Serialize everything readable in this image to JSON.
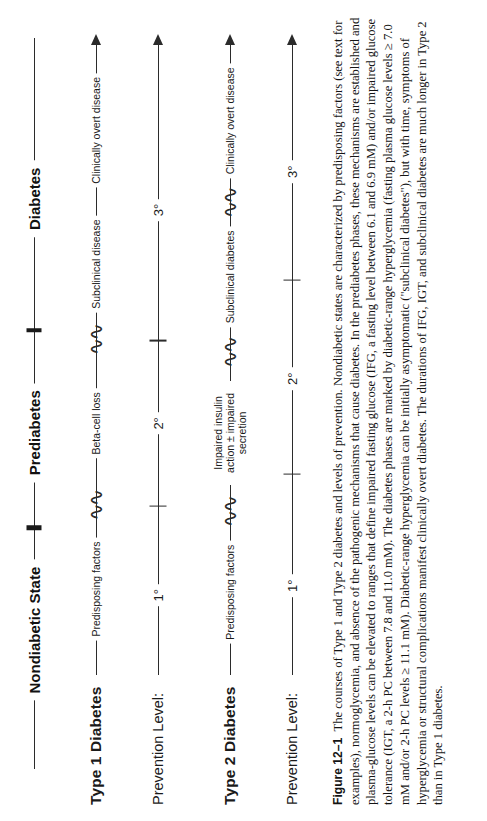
{
  "figure": {
    "number_label": "Figure 12–1",
    "caption": "The courses of Type 1 and Type 2 diabetes and levels of prevention. Nondiabetic states are characterized by predisposing factors (see text for examples), normoglycemia, and absence of the pathogenic mechanisms that cause diabetes. In the prediabetes phases, these mechanisms are established and plasma-glucose levels can be elevated to ranges that define impaired fasting glucose (IFG, a fasting level between 6.1 and 6.9 mM) and/or impaired glucose tolerance (IGT, a 2-h PC between 7.8 and 11.0 mM). The diabetes phases are marked by diabetic-range hyperglycemia (fasting plasma glucose levels ≥ 7.0 mM and/or 2-h PC levels ≥ 11.1 mM). Diabetic-range hyperglycemia can be initially asymptomatic (\"subclinical diabetes\"), but with time, symptoms of hyperglycemia or structural complications manifest clinically overt diabetes. The durations of IFG, IGT, and subclinical diabetes are much longer in Type 2 than in Type 1 diabetes."
  },
  "states_axis": {
    "name": "disease-state-axis",
    "labels": [
      {
        "text": "Nondiabetic State",
        "pos_pct": 19
      },
      {
        "text": "Prediabetes",
        "pos_pct": 46
      },
      {
        "text": "Diabetes",
        "pos_pct": 78
      }
    ],
    "dividers_pct": [
      33,
      60
    ]
  },
  "rows": [
    {
      "id": "type-1-diabetes",
      "label": "Type 1 Diabetes",
      "label_style": "bold",
      "axis_start_pct": 20,
      "segments": [
        {
          "text": "Predisposing factors",
          "pos_pct": 30.5
        },
        {
          "text": "Beta-cell loss",
          "pos_pct": 50
        },
        {
          "text": "Subclinical disease",
          "pos_pct": 67.5
        },
        {
          "text": "Clinically overt disease",
          "pos_pct": 86
        }
      ],
      "breaks_pct": [
        41,
        59.5
      ]
    },
    {
      "id": "prevention-level-type-1",
      "label": "Prevention Level:",
      "label_style": "plain",
      "axis_start_pct": 21,
      "levels": [
        {
          "text": "1°",
          "pos_pct": 30
        },
        {
          "text": "2°",
          "pos_pct": 50
        },
        {
          "text": "3°",
          "pos_pct": 76
        }
      ],
      "ticks_pct": [
        40,
        61
      ]
    },
    {
      "id": "type-2-diabetes",
      "label": "Type 2 Diabetes",
      "label_style": "bold",
      "axis_start_pct": 20,
      "segments": [
        {
          "text": "Predisposing factors",
          "pos_pct": 30.5
        },
        {
          "text": "Impaired insulin action ± impaired secretion",
          "pos_pct": 50,
          "two_line": true
        },
        {
          "text": "Subclinical diabetes",
          "pos_pct": 70
        },
        {
          "text": "Clinically overt disease",
          "pos_pct": 88
        }
      ],
      "breaks_pct": [
        40.5,
        60.5,
        79
      ]
    },
    {
      "id": "prevention-level-type-2",
      "label": "Prevention Level:",
      "label_style": "plain",
      "axis_start_pct": 21,
      "levels": [
        {
          "text": "1°",
          "pos_pct": 31
        },
        {
          "text": "2°",
          "pos_pct": 56
        },
        {
          "text": "3°",
          "pos_pct": 81
        }
      ],
      "ticks_pct": [
        44,
        69
      ]
    }
  ],
  "glyphs": {
    "break_symbol": "⟨⟨",
    "squiggle": "∫∫"
  }
}
